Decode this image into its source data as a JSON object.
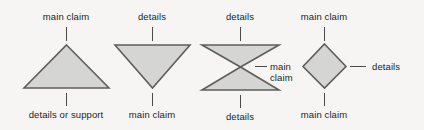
{
  "figure": {
    "background_color": "#f6f5f3",
    "shape_fill_color": "#d5d5d3",
    "shape_stroke_color": "#5e5e5e",
    "connector_color": "#4a4a4a",
    "text_color": "#1d1d1d"
  },
  "diagrams": [
    {
      "id": "triangle-up",
      "shape": "triangle-pointing-up",
      "top_label": "main claim",
      "bottom_label": "details or support"
    },
    {
      "id": "triangle-down",
      "shape": "triangle-pointing-down",
      "top_label": "details",
      "bottom_label": "main claim"
    },
    {
      "id": "hourglass",
      "shape": "hourglass",
      "top_label": "details",
      "bottom_label": "details",
      "right_label_line1": "main",
      "right_label_line2": "claim"
    },
    {
      "id": "diamond",
      "shape": "diamond",
      "top_label": "main claim",
      "bottom_label": "main claim",
      "right_label": "details"
    }
  ]
}
